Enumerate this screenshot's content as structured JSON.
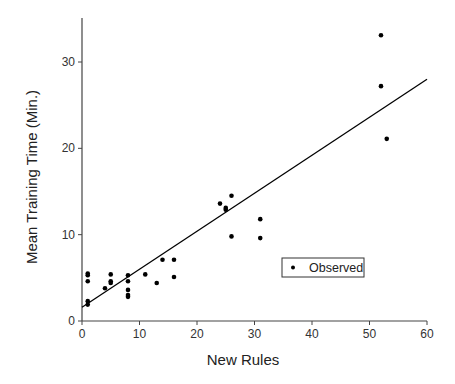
{
  "chart_data": {
    "type": "scatter",
    "title": "",
    "xlabel": "New Rules",
    "ylabel": "Mean Training Time (Min.)",
    "xlim": [
      0,
      60
    ],
    "ylim": [
      0,
      35
    ],
    "xticks": [
      0,
      10,
      20,
      30,
      40,
      50,
      60
    ],
    "yticks": [
      0,
      10,
      20,
      30
    ],
    "grid": false,
    "legend": {
      "position": "inside-lower-right",
      "entries": [
        "Observed"
      ]
    },
    "series": [
      {
        "name": "Observed",
        "marker": "dot",
        "color": "#000000",
        "points": [
          [
            1,
            5.5
          ],
          [
            1,
            5.3
          ],
          [
            1,
            4.6
          ],
          [
            1,
            2.3
          ],
          [
            1,
            1.9
          ],
          [
            4,
            3.8
          ],
          [
            5,
            5.4
          ],
          [
            5,
            4.6
          ],
          [
            5,
            4.4
          ],
          [
            8,
            5.3
          ],
          [
            8,
            4.6
          ],
          [
            8,
            3.6
          ],
          [
            8,
            3.0
          ],
          [
            8,
            2.8
          ],
          [
            11,
            5.4
          ],
          [
            13,
            4.4
          ],
          [
            14,
            7.1
          ],
          [
            16,
            7.1
          ],
          [
            16,
            5.1
          ],
          [
            24,
            13.6
          ],
          [
            25,
            13.1
          ],
          [
            25,
            12.9
          ],
          [
            26,
            14.5
          ],
          [
            26,
            9.8
          ],
          [
            31,
            11.8
          ],
          [
            31,
            9.6
          ],
          [
            52,
            33.1
          ],
          [
            52,
            27.2
          ],
          [
            53,
            21.1
          ]
        ]
      },
      {
        "name": "Fit",
        "type": "line",
        "color": "#000000",
        "points": [
          [
            0,
            1.6
          ],
          [
            60,
            28.0
          ]
        ]
      }
    ]
  }
}
